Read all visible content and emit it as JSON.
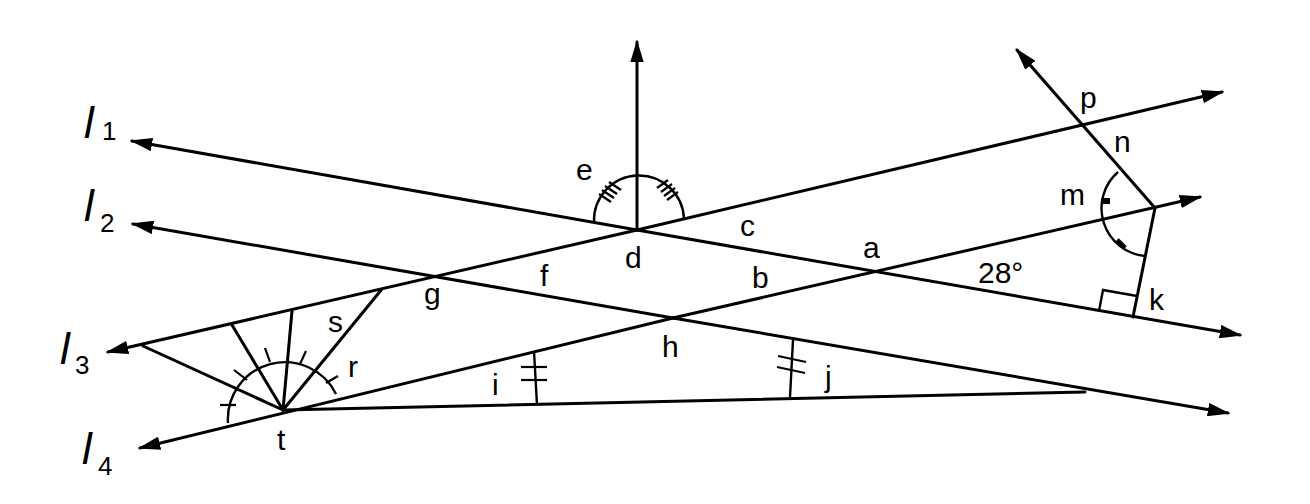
{
  "diagram": {
    "type": "geometry-angles-with-lines",
    "line_names": [
      {
        "name": "l",
        "sub": "1"
      },
      {
        "name": "l",
        "sub": "2"
      },
      {
        "name": "l",
        "sub": "3"
      },
      {
        "name": "l",
        "sub": "4"
      }
    ],
    "angle_labels": {
      "a": "a",
      "b": "b",
      "c": "c",
      "d": "d",
      "e": "e",
      "f": "f",
      "g": "g",
      "h": "h",
      "i": "i",
      "j": "j",
      "k": "k",
      "m": "m",
      "n": "n",
      "p": "p",
      "r": "r",
      "s": "s",
      "t": "t"
    },
    "given_angle": "28°",
    "colors": {
      "stroke": "#000000",
      "background": "#ffffff"
    }
  }
}
